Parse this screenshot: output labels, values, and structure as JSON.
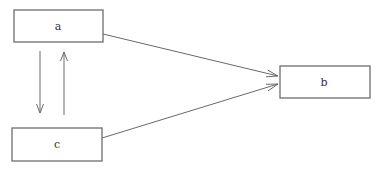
{
  "diagram": {
    "type": "flow",
    "nodes": [
      {
        "id": "a",
        "label": "a",
        "x": 14,
        "y": 10,
        "w": 89,
        "h": 32
      },
      {
        "id": "b",
        "label": "b",
        "x": 280,
        "y": 66,
        "w": 90,
        "h": 32
      },
      {
        "id": "c",
        "label": "c",
        "x": 12,
        "y": 128,
        "w": 90,
        "h": 33
      }
    ],
    "edges": [
      {
        "from": "a",
        "to": "b",
        "label": ""
      },
      {
        "from": "c",
        "to": "b",
        "label": ""
      },
      {
        "from": "a",
        "to": "c",
        "label": ""
      },
      {
        "from": "c",
        "to": "a",
        "label": ""
      }
    ],
    "colors": {
      "stroke": "#6e6e6e",
      "text": "#333333",
      "background": "#ffffff"
    }
  }
}
